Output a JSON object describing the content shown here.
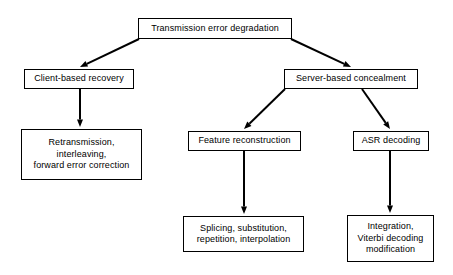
{
  "diagram": {
    "background_color": "#ffffff",
    "line_color": "#000000",
    "text_color": "#000000",
    "nodes": [
      {
        "id": "root",
        "name": "transmission-error-degradation",
        "label": "Transmission error degradation",
        "x": 138,
        "y": 18,
        "w": 154,
        "h": 21
      },
      {
        "id": "client",
        "name": "client-based-recovery",
        "label": "Client-based recovery",
        "x": 24,
        "y": 69,
        "w": 110,
        "h": 20
      },
      {
        "id": "server",
        "name": "server-based-concealment",
        "label": "Server-based concealment",
        "x": 284,
        "y": 69,
        "w": 134,
        "h": 20
      },
      {
        "id": "retransmission",
        "name": "retransmission-interleaving-fec",
        "label": "Retransmission,\ninterleaving,\nforward error correction",
        "x": 21,
        "y": 129,
        "w": 121,
        "h": 51
      },
      {
        "id": "feature",
        "name": "feature-reconstruction",
        "label": "Feature reconstruction",
        "x": 188,
        "y": 131,
        "w": 113,
        "h": 20
      },
      {
        "id": "asr",
        "name": "asr-decoding",
        "label": "ASR decoding",
        "x": 353,
        "y": 131,
        "w": 76,
        "h": 20
      },
      {
        "id": "splicing",
        "name": "splicing-substitution-repetition-interpolation",
        "label": "Splicing, substitution,\nrepetition, interpolation",
        "x": 183,
        "y": 216,
        "w": 121,
        "h": 36
      },
      {
        "id": "integration",
        "name": "integration-viterbi-decoding-modification",
        "label": "Integration,\nViterbi decoding\nmodification",
        "x": 347,
        "y": 215,
        "w": 87,
        "h": 47
      }
    ],
    "edges": [
      {
        "name": "edge-root-to-client",
        "from": "root",
        "to": "client",
        "x1": 139,
        "y1": 39,
        "x2": 80,
        "y2": 67
      },
      {
        "name": "edge-root-to-server",
        "from": "root",
        "to": "server",
        "x1": 291,
        "y1": 39,
        "x2": 351,
        "y2": 67
      },
      {
        "name": "edge-client-to-retransmission",
        "from": "client",
        "to": "retransmission",
        "x1": 80,
        "y1": 89,
        "x2": 80,
        "y2": 127
      },
      {
        "name": "edge-server-to-feature",
        "from": "server",
        "to": "feature",
        "x1": 285,
        "y1": 89,
        "x2": 244,
        "y2": 129
      },
      {
        "name": "edge-server-to-asr",
        "from": "server",
        "to": "asr",
        "x1": 362,
        "y1": 89,
        "x2": 390,
        "y2": 129
      },
      {
        "name": "edge-feature-to-splicing",
        "from": "feature",
        "to": "splicing",
        "x1": 244,
        "y1": 151,
        "x2": 244,
        "y2": 214
      },
      {
        "name": "edge-asr-to-integration",
        "from": "asr",
        "to": "integration",
        "x1": 390,
        "y1": 151,
        "x2": 390,
        "y2": 213
      }
    ]
  }
}
